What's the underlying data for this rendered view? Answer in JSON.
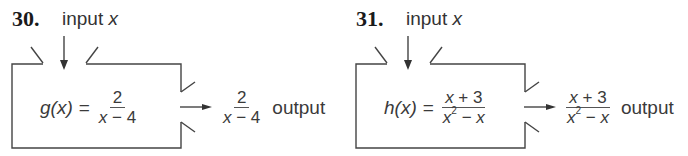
{
  "problems": [
    {
      "number": "30.",
      "input_label": "input",
      "input_var": "x",
      "function_name": "g",
      "function_arg": "(x)",
      "equals": "=",
      "numerator": "2",
      "denominator_parts": [
        "x",
        " − 4"
      ],
      "output_numerator": "2",
      "output_denominator_parts": [
        "x",
        " − 4"
      ],
      "output_label": "output"
    },
    {
      "number": "31.",
      "input_label": "input",
      "input_var": "x",
      "function_name": "h",
      "function_arg": "(x)",
      "equals": "=",
      "numerator_parts": [
        "x",
        " + 3"
      ],
      "denominator_parts": [
        "x",
        "2",
        " − ",
        "x"
      ],
      "output_numerator_parts": [
        "x",
        " + 3"
      ],
      "output_denominator_parts": [
        "x",
        "2",
        " − ",
        "x"
      ],
      "output_label": "output"
    }
  ],
  "colors": {
    "line": "#444444",
    "text": "#3a3a3a",
    "number": "#1a1a1a"
  }
}
